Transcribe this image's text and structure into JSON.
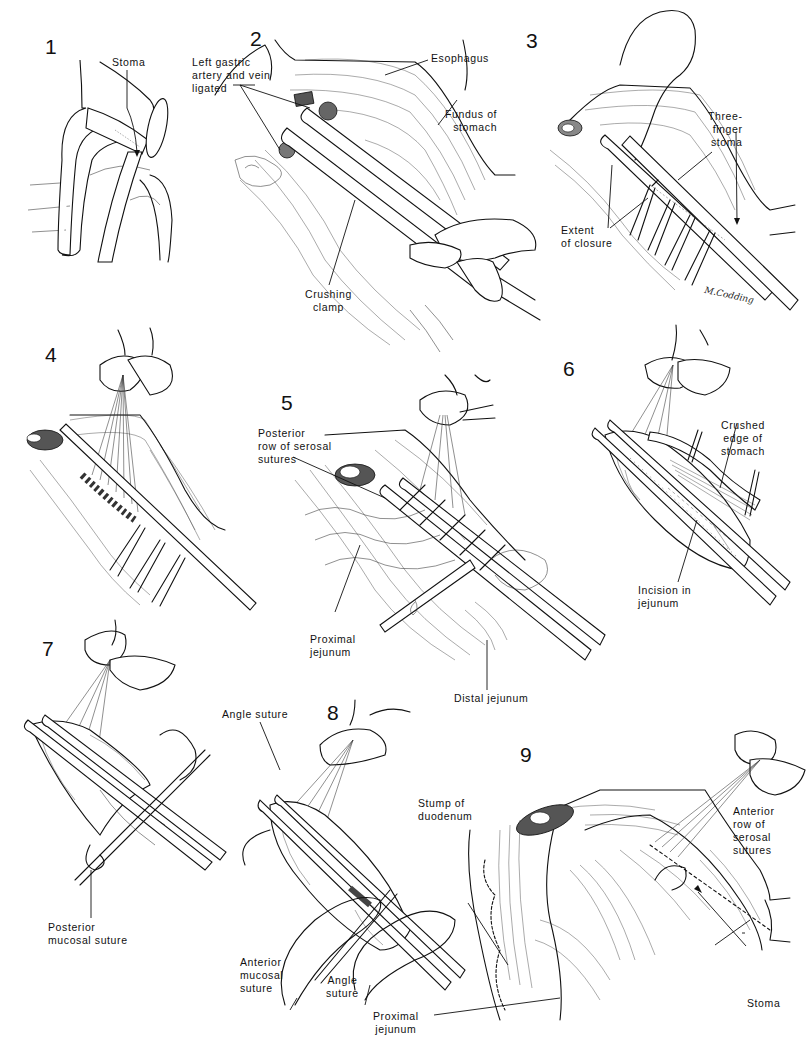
{
  "plate": {
    "title": "Surgical illustration plate – gastrojejunostomy steps",
    "signature": "M.Codding"
  },
  "panels": [
    {
      "number": "1",
      "labels": [
        "Stoma"
      ]
    },
    {
      "number": "2",
      "labels": [
        "Left gastric\nartery and vein\nligated",
        "Esophagus",
        "Fundus of\nstomach",
        "Crushing\nclamp"
      ]
    },
    {
      "number": "3",
      "labels": [
        "Three-\nfinger\nstoma",
        "Extent\nof closure"
      ]
    },
    {
      "number": "4",
      "labels": []
    },
    {
      "number": "5",
      "labels": [
        "Posterior\nrow of serosal\nsutures",
        "Proximal\njejunum",
        "Distal jejunum"
      ]
    },
    {
      "number": "6",
      "labels": [
        "Crushed\nedge of\nstomach",
        "Incision in\njejunum"
      ]
    },
    {
      "number": "7",
      "labels": [
        "Posterior\nmucosal suture"
      ]
    },
    {
      "number": "8",
      "labels": [
        "Angle suture",
        "Anterior\nmucosal\nsuture",
        "Angle\nsuture"
      ]
    },
    {
      "number": "9",
      "labels": [
        "Stump of\nduodenum",
        "Anterior\nrow of\nserosal\nsutures",
        "Proximal\njejunum",
        "Stoma"
      ]
    }
  ]
}
